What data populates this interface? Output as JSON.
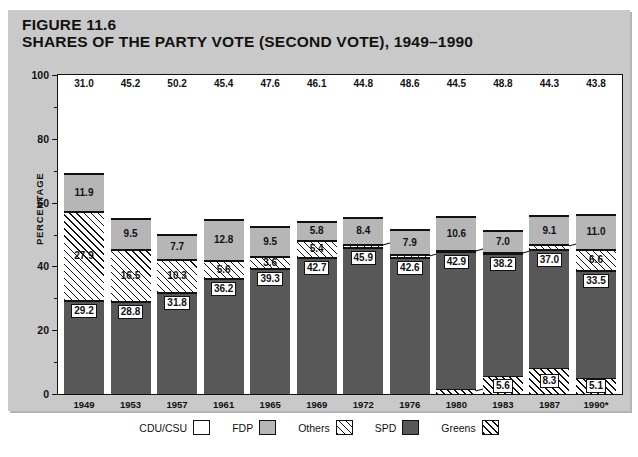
{
  "figure": {
    "number_label": "FIGURE 11.6",
    "title": "SHARES OF THE PARTY VOTE (SECOND VOTE), 1949–1990"
  },
  "axes": {
    "ylabel": "PERCENTAGE",
    "yticks": [
      0,
      20,
      40,
      60,
      80,
      100
    ],
    "yminor": [
      10,
      30,
      50,
      70,
      90
    ],
    "ylim": [
      0,
      100
    ]
  },
  "legend": {
    "items": [
      {
        "label": "CDU/CSU",
        "swatch": "white-swatch",
        "color": "#ffffff"
      },
      {
        "label": "FDP",
        "swatch": "light-gray-swatch",
        "color": "#b6b6b6"
      },
      {
        "label": "Others",
        "swatch": "light-hatch-swatch",
        "color": "#ffffff"
      },
      {
        "label": "SPD",
        "swatch": "dark-gray-swatch",
        "color": "#585858"
      },
      {
        "label": "Greens",
        "swatch": "dense-hatch-swatch",
        "color": "#ffffff"
      }
    ]
  },
  "chart_data": {
    "type": "bar",
    "title": "SHARES OF THE PARTY VOTE (SECOND VOTE), 1949–1990",
    "subtitle": "FIGURE 11.6",
    "stacked": true,
    "xlabel": "",
    "ylabel": "PERCENTAGE",
    "ylim": [
      0,
      100
    ],
    "grid": false,
    "legend_position": "bottom",
    "categories": [
      "1949",
      "1953",
      "1957",
      "1961",
      "1965",
      "1969",
      "1972",
      "1976",
      "1980",
      "1983",
      "1987",
      "1990*"
    ],
    "stack_order_bottom_to_top": [
      "Greens",
      "SPD",
      "Others",
      "FDP",
      "CDU/CSU"
    ],
    "series": [
      {
        "name": "Greens",
        "values": [
          0,
          0,
          0,
          0,
          0,
          0,
          0,
          0,
          1.5,
          5.6,
          8.3,
          5.1
        ]
      },
      {
        "name": "SPD",
        "values": [
          29.2,
          28.8,
          31.8,
          36.2,
          39.3,
          42.7,
          45.9,
          42.6,
          42.9,
          38.2,
          37.0,
          33.5
        ]
      },
      {
        "name": "Others",
        "values": [
          27.9,
          16.5,
          10.3,
          5.6,
          3.6,
          5.4,
          0.9,
          0.9,
          0.5,
          0.4,
          1.3,
          6.6
        ]
      },
      {
        "name": "FDP",
        "values": [
          11.9,
          9.5,
          7.7,
          12.8,
          9.5,
          5.8,
          8.4,
          7.9,
          10.6,
          7.0,
          9.1,
          11.0
        ]
      },
      {
        "name": "CDU/CSU",
        "values": [
          31.0,
          45.2,
          50.2,
          45.4,
          47.6,
          46.1,
          44.8,
          48.6,
          44.5,
          48.8,
          44.3,
          43.8
        ]
      }
    ]
  }
}
